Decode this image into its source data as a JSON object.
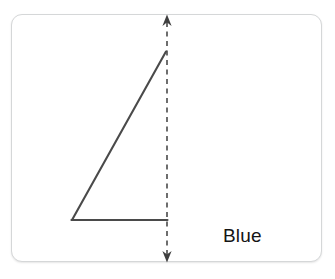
{
  "figure": {
    "label": "Blue",
    "stroke_color": "#4a4a4a",
    "dashed_color": "#4a4a4a",
    "card_border_color": "#d5d7d8",
    "background_color": "#ffffff",
    "label_color": "#141414",
    "triangle": {
      "apex": [
        166,
        51
      ],
      "bottom_left": [
        72,
        220
      ],
      "bottom_right": [
        167,
        220
      ],
      "drawn_sides": [
        "hypotenuse",
        "base"
      ]
    },
    "axis_arrow": {
      "x": 167,
      "top_y": 15,
      "bottom_y": 262,
      "style": "dashed",
      "arrowheads": [
        "up",
        "down"
      ]
    }
  }
}
